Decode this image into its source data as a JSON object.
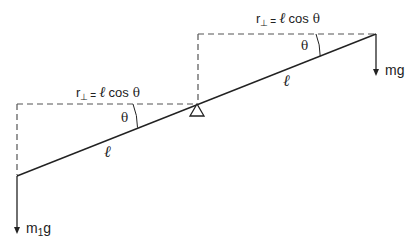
{
  "diagram": {
    "colors": {
      "ink": "#222222",
      "dash": "#555555",
      "background": "#ffffff"
    },
    "labels": {
      "top_r_perp_prefix": "r",
      "top_r_perp_sub": "⊥",
      "top_equals": "=",
      "top_ell": "ℓ",
      "top_cos": "cos",
      "top_theta": "θ",
      "left_r_perp_prefix": "r",
      "left_r_perp_sub": "⊥",
      "left_equals": "=",
      "left_ell": "ℓ",
      "left_cos": "cos",
      "left_theta": "θ",
      "angle_right": "θ",
      "angle_left": "θ",
      "length_right": "ℓ",
      "length_left": "ℓ",
      "force_right": "mg",
      "force_left_m": "m",
      "force_left_sub": "1",
      "force_left_g": "g"
    },
    "geometry": {
      "lever": {
        "x1": 17,
        "y1": 176,
        "x2": 376,
        "y2": 34
      },
      "pivot": {
        "x": 197,
        "y": 105
      },
      "top_dashed": {
        "y": 34,
        "x_start": 198,
        "x_end": 376
      },
      "top_vertical_dashed": {
        "x": 198,
        "y_start": 34,
        "y_end": 103
      },
      "left_dashed": {
        "y": 104,
        "x_start": 17,
        "x_end": 197
      },
      "left_vertical_dashed": {
        "x": 17,
        "y_start": 104,
        "y_end": 176
      },
      "arrow_right": {
        "x": 376,
        "y_start": 34,
        "y_end": 74
      },
      "arrow_left": {
        "x": 17,
        "y_start": 176,
        "y_end": 232
      }
    }
  }
}
